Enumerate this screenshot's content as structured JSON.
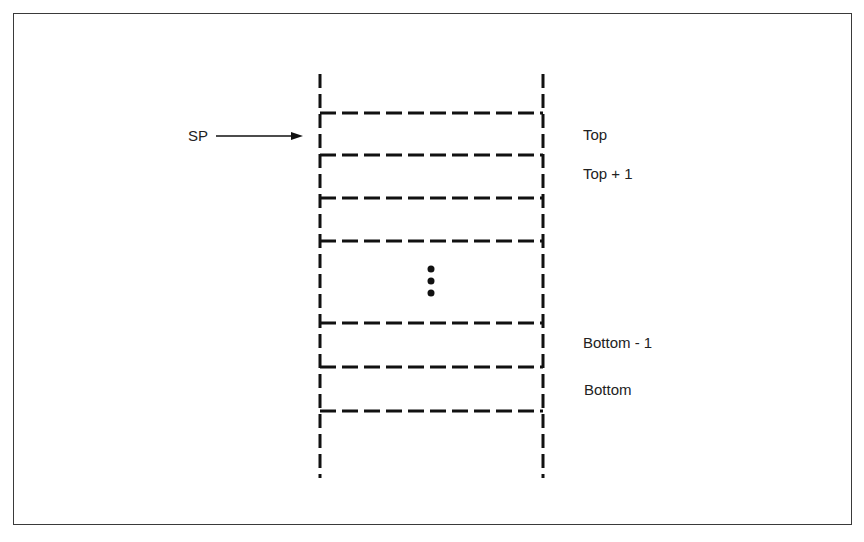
{
  "diagram": {
    "type": "stack",
    "pointer": {
      "label": "SP",
      "target": "Top"
    },
    "slots": [
      {
        "label": "Top"
      },
      {
        "label": "Top + 1"
      },
      {
        "label": ""
      },
      {
        "label": "⋮"
      },
      {
        "label": "Bottom - 1"
      },
      {
        "label": "Bottom"
      }
    ],
    "labels": {
      "top": "Top",
      "top_plus_1": "Top + 1",
      "bottom_minus_1": "Bottom - 1",
      "bottom": "Bottom",
      "sp": "SP"
    },
    "ellipsis": "vertical-dots"
  }
}
